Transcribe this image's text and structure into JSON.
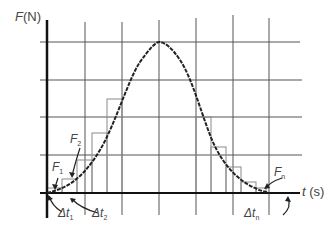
{
  "diagram": {
    "y_axis": {
      "label_var": "F",
      "label_unit": "(N)"
    },
    "x_axis": {
      "label_var": "t",
      "label_unit": "(s)"
    },
    "annotations": {
      "F1": {
        "var": "F",
        "sub": "1"
      },
      "F2": {
        "var": "F",
        "sub": "2"
      },
      "Fn": {
        "var": "F",
        "sub": "n"
      },
      "dt1": {
        "var": "Δt",
        "sub": "1"
      },
      "dt2": {
        "var": "Δt",
        "sub": "2"
      },
      "dtn": {
        "var": "Δt",
        "sub": "n"
      }
    },
    "grid": {
      "vertical_x": [
        85,
        122,
        159,
        196,
        233,
        269
      ],
      "horizontal_y": [
        42,
        80,
        117,
        155
      ]
    },
    "rectangles": [
      {
        "x": 47,
        "w": 15,
        "top": 188
      },
      {
        "x": 62,
        "w": 15,
        "top": 179
      },
      {
        "x": 77,
        "w": 15,
        "top": 160
      },
      {
        "x": 92,
        "w": 15,
        "top": 133
      },
      {
        "x": 107,
        "w": 15,
        "top": 99
      },
      {
        "x": 196,
        "w": 15,
        "top": 117
      },
      {
        "x": 211,
        "w": 15,
        "top": 147
      },
      {
        "x": 226,
        "w": 15,
        "top": 167
      },
      {
        "x": 241,
        "w": 15,
        "top": 182
      },
      {
        "x": 256,
        "w": 10,
        "top": 188
      }
    ],
    "colors": {
      "curve": "#222222",
      "grid": "#555555",
      "axis": "#111111",
      "rect": "#888888"
    }
  }
}
